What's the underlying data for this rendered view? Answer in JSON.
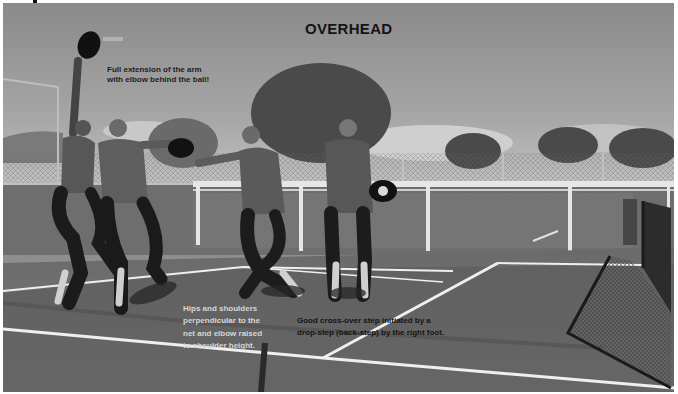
{
  "image": {
    "title": "OVERHEAD",
    "style": "grayscale photograph",
    "annotations": [
      {
        "id": "arm",
        "lines": [
          "Full extension of the arm",
          "with elbow behind the ball!"
        ],
        "color": "#1e1e1e"
      },
      {
        "id": "hips",
        "lines": [
          "Hips and shoulders",
          "perpendicular to the",
          "net and elbow raised",
          "to shoulder height."
        ],
        "color": "#d6d6d6"
      },
      {
        "id": "step",
        "lines": [
          "Good cross-over step initiated by a",
          "drop-step (back-step) by the right foot."
        ],
        "color": "#141414"
      }
    ],
    "scene": {
      "subject": "Sequence of four figures of a pickleball player performing an overhead shot on an outdoor court",
      "elements": [
        "sky with clouds",
        "trees",
        "chain-link fence",
        "court surface",
        "court lines",
        "net"
      ]
    }
  }
}
